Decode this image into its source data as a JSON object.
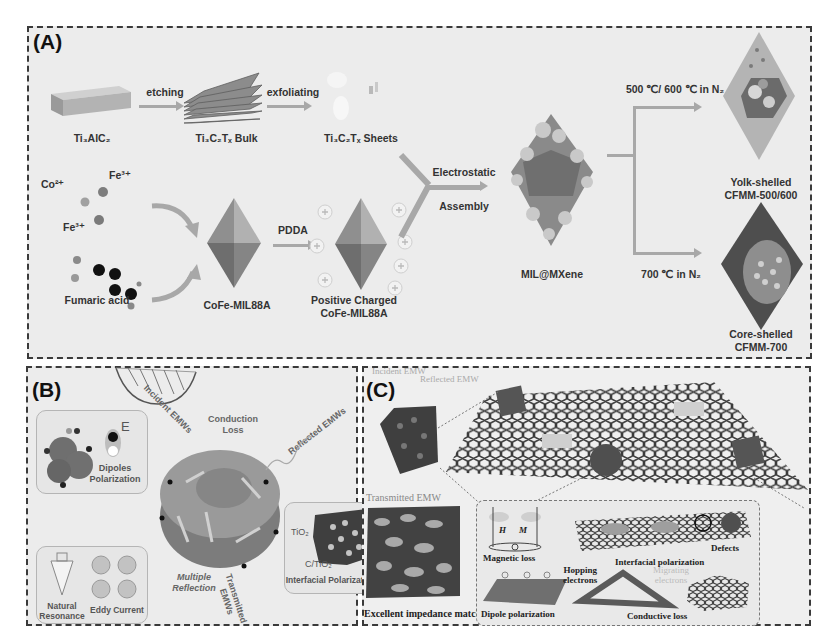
{
  "panels": {
    "a": {
      "label": "(A)",
      "steps": {
        "ti3alc2": "Ti₃AlC₂",
        "etching": "etching",
        "bulk": "Ti₃C₂Tₓ Bulk",
        "exfoliating": "exfoliating",
        "sheets": "Ti₃C₂Tₓ Sheets",
        "co2": "Co²⁺",
        "fe3_top": "Fe³⁺",
        "fe3_bottom": "Fe³⁺",
        "fumaric": "Fumaric acid",
        "cofe": "CoFe-MIL88A",
        "pdda": "PDDA",
        "positive_line1": "Positive Charged",
        "positive_line2": "CoFe-MIL88A",
        "electrostatic": "Electrostatic",
        "assembly": "Assembly",
        "mil_mxene": "MIL@MXene",
        "cond_upper": "500 ℃/ 600 ℃ in N₂",
        "cond_lower": "700 ℃ in N₂",
        "yolk_line1": "Yolk-shelled",
        "yolk_line2": "CFMM-500/600",
        "core_line1": "Core-shelled",
        "core_line2": "CFMM-700"
      }
    },
    "b": {
      "label": "(B)",
      "texts": {
        "incident": "Incident EMWs",
        "conduction_line1": "Conduction",
        "conduction_line2": "Loss",
        "reflected": "Reflected EMWs",
        "dipoles_line1": "Dipoles",
        "dipoles_line2": "Polarization",
        "e_field": "E",
        "tio2": "TiO₂",
        "c_tio2": "C/TiO₂",
        "interfacial": "Interfacial Polarization",
        "multiple_line1": "Multiple",
        "multiple_line2": "Reflection",
        "transmitted_line1": "Transmitted",
        "transmitted_line2": "EMWs",
        "natural_line1": "Natural",
        "natural_line2": "Resonance",
        "eddy": "Eddy Current"
      }
    },
    "c": {
      "label": "(C)",
      "texts": {
        "incident": "Incident EMW",
        "reflected": "Reflected EMW",
        "transmitted": "Transmitted EMW",
        "impedance": "Excellent impedance matching",
        "h": "H",
        "m": "M",
        "magnetic": "Magnetic loss",
        "interfacial": "Interfacial polarization",
        "defects": "Defects",
        "hopping_line1": "Hopping",
        "hopping_line2": "electrons",
        "migrating_line1": "Migrating",
        "migrating_line2": "electrons",
        "dipole": "Dipole polarization",
        "conductive": "Conductive loss"
      }
    }
  },
  "colors": {
    "panel_bg": "#ececec",
    "border": "#3a3a3a",
    "arrow": "#a8a8a8",
    "text": "#333333"
  }
}
